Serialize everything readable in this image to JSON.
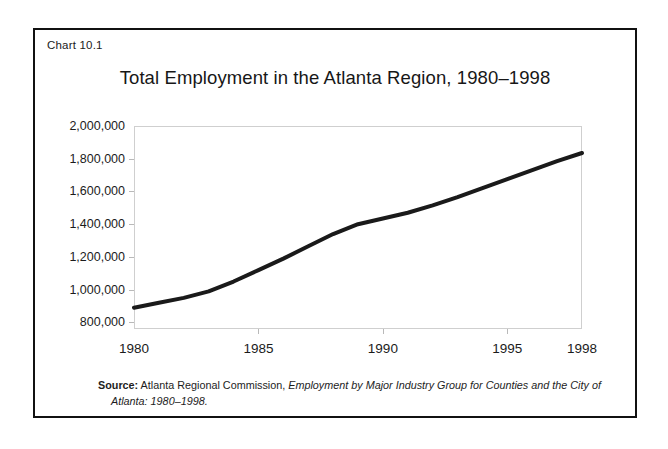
{
  "figure": {
    "chart_number": "Chart 10.1",
    "title": "Total Employment in the Atlanta Region, 1980–1998",
    "source": {
      "label": "Source:",
      "organization": "Atlanta Regional Commission,",
      "publication": "Employment by Major Industry Group for Counties and the City of Atlanta: 1980–1998."
    }
  },
  "chart_data": {
    "type": "line",
    "title": "Total Employment in the Atlanta Region, 1980–1998",
    "xlabel": "",
    "ylabel": "",
    "x": [
      1980,
      1981,
      1982,
      1983,
      1984,
      1985,
      1986,
      1987,
      1988,
      1989,
      1990,
      1991,
      1992,
      1993,
      1994,
      1995,
      1996,
      1997,
      1998
    ],
    "values": [
      890000,
      920000,
      950000,
      990000,
      1050000,
      1120000,
      1190000,
      1265000,
      1340000,
      1400000,
      1435000,
      1470000,
      1515000,
      1565000,
      1620000,
      1675000,
      1730000,
      1785000,
      1835000
    ],
    "series": [
      {
        "name": "Total Employment",
        "values": [
          890000,
          920000,
          950000,
          990000,
          1050000,
          1120000,
          1190000,
          1265000,
          1340000,
          1400000,
          1435000,
          1470000,
          1515000,
          1565000,
          1620000,
          1675000,
          1730000,
          1785000,
          1835000
        ]
      }
    ],
    "xlim": [
      1980,
      1998
    ],
    "ylim": [
      760000,
      2000000
    ],
    "xticks": [
      1980,
      1985,
      1990,
      1995,
      1998
    ],
    "xtick_labels": [
      "1980",
      "1985",
      "1990",
      "1995",
      "1998"
    ],
    "yticks": [
      800000,
      1000000,
      1200000,
      1400000,
      1600000,
      1800000,
      2000000
    ],
    "ytick_labels": [
      "800,000",
      "1,000,000",
      "1,200,000",
      "1,400,000",
      "1,600,000",
      "1,800,000",
      "2,000,000"
    ],
    "grid": false,
    "legend": "none",
    "line_color": "#1a1a1a",
    "line_width": 4
  }
}
